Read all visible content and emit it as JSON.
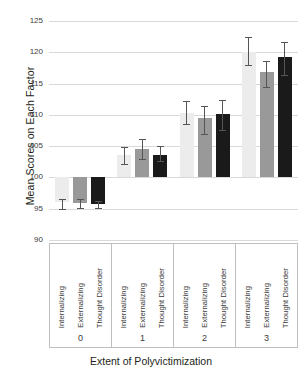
{
  "chart_data": {
    "type": "bar",
    "title": "",
    "xlabel": "Extent of Polyvictimization",
    "ylabel": "Mean Scores on Each Factor",
    "ylim": [
      90,
      125
    ],
    "yticks": [
      90,
      95,
      100,
      105,
      110,
      115,
      120,
      125
    ],
    "grid": true,
    "legend_position": "none",
    "categories": [
      "0",
      "1",
      "2",
      "3"
    ],
    "subcategories": [
      "Internalizing",
      "Externalizing",
      "Thought Disorder"
    ],
    "series": [
      {
        "name": "Internalizing",
        "color": "#ececec",
        "values": [
          96.0,
          103.6,
          110.3,
          120.0
        ],
        "err_low": [
          94.9,
          102.2,
          108.5,
          117.9
        ],
        "err_high": [
          96.5,
          104.9,
          112.2,
          122.4
        ]
      },
      {
        "name": "Externalizing",
        "color": "#999999",
        "values": [
          95.9,
          104.6,
          109.5,
          116.8
        ],
        "err_low": [
          95.1,
          102.9,
          106.9,
          114.5
        ],
        "err_high": [
          96.6,
          106.2,
          111.4,
          118.6
        ]
      },
      {
        "name": "Thought Disorder",
        "color": "#1a1a1a",
        "values": [
          95.7,
          103.6,
          110.2,
          119.2
        ],
        "err_low": [
          95.1,
          102.6,
          107.6,
          116.4
        ],
        "err_high": [
          96.3,
          105.0,
          112.3,
          121.7
        ]
      }
    ],
    "baseline": 100,
    "axis_tick_labels": [
      "125",
      "120",
      "115",
      "110",
      "105",
      "100",
      "95",
      "90"
    ],
    "group_labels": [
      "0",
      "1",
      "2",
      "3"
    ]
  },
  "colors": {
    "grid": "#d9d9d9",
    "border": "#bfbfbf",
    "text": "#231f20",
    "tick_text": "#3b3b3b",
    "error_bar": "#555555",
    "background": "#ffffff"
  }
}
